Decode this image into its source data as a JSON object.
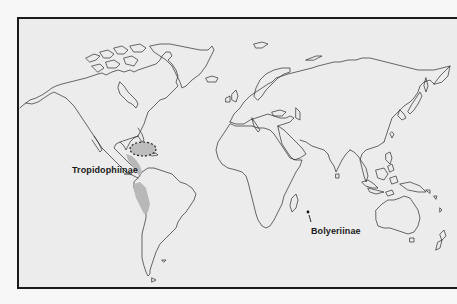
{
  "map": {
    "type": "world outline map (distribution map)",
    "background_color": "#ececec",
    "frame_color": "#1a1a1a",
    "coastline_color": "#2b2b2b",
    "range_fill_color": "#b8b8b8"
  },
  "labels": {
    "tropidophiinae": "Tropidophiinae",
    "bolyeriinae": "Bolyeriinae"
  },
  "ranges": [
    {
      "name": "Tropidophiinae",
      "regions": [
        "Caribbean / Greater Antilles (dashed outline)",
        "Central America",
        "Western South America (Andes)"
      ],
      "style": "stippled gray shading"
    },
    {
      "name": "Bolyeriinae",
      "regions": [
        "Mauritius / Round Island (Indian Ocean)"
      ],
      "style": "single dot marker"
    }
  ]
}
